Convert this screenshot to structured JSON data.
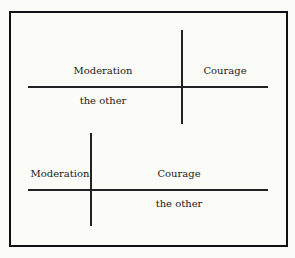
{
  "diagrams": [
    {
      "top_left": "Moderation",
      "top_right": "Courage",
      "bottom_left": "the other"
    },
    {
      "top_left": "Moderation",
      "top_right": "Courage",
      "bottom_right": "the other"
    }
  ]
}
